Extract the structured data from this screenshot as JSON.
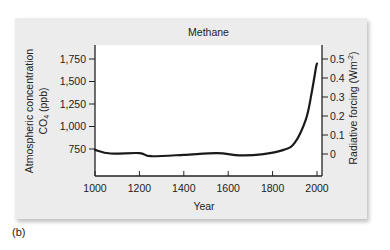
{
  "chart_data": {
    "type": "line",
    "title": "Methane",
    "xlabel": "Year",
    "ylabel": "Atmospheric concentration CO4 (ppb)",
    "ylabel_line1": "Atmospheric concentration",
    "ylabel_line2": "CO",
    "ylabel_sub": "4",
    "ylabel_unit": " (ppb)",
    "y2label": "Radiative forcing (Wm",
    "y2label_sup": "-2",
    "y2label_close": ")",
    "xlim": [
      1000,
      2000
    ],
    "ylim": [
      750,
      1750
    ],
    "y2lim": [
      0,
      0.5
    ],
    "x_ticks": [
      "1000",
      "1200",
      "1400",
      "1600",
      "1800",
      "2000"
    ],
    "y_ticks": [
      "1,750",
      "1,500",
      "1,250",
      "1,000",
      "750"
    ],
    "y2_ticks": [
      "0.5",
      "0.4",
      "0.3",
      "0.2",
      "0.1",
      "0"
    ],
    "grid": false,
    "legend": null,
    "series": [
      {
        "name": "Methane concentration",
        "x": [
          1000,
          1070,
          1200,
          1250,
          1400,
          1550,
          1650,
          1750,
          1850,
          1900,
          1950,
          1975,
          1995,
          2000
        ],
        "y": [
          740,
          700,
          705,
          670,
          685,
          705,
          680,
          690,
          740,
          820,
          1080,
          1360,
          1650,
          1700
        ]
      }
    ],
    "panel_label": "(b)"
  }
}
